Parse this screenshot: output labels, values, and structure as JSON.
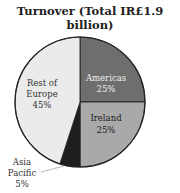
{
  "chart_data": {
    "type": "pie",
    "title": "Turnover (Total IR£1.9 billion)",
    "title_lines": [
      "Turnover (Total IR£1.9",
      "billion)"
    ],
    "categories": [
      "Americas",
      "Ireland",
      "Asia Pacific",
      "Rest of Europe"
    ],
    "values": [
      25,
      25,
      5,
      45
    ],
    "unit": "%",
    "slices": [
      {
        "label": "Americas",
        "value": 25,
        "display": "25%",
        "color": "#6e6e6e",
        "text_color": "#eeeeee"
      },
      {
        "label": "Ireland",
        "value": 25,
        "display": "25%",
        "color": "#a9a9a9",
        "text_color": "#222222"
      },
      {
        "label": "Asia Pacific",
        "label_lines": [
          "Asia",
          "Pacific"
        ],
        "value": 5,
        "display": "5%",
        "color": "#1e1e1e",
        "text_color": "#333333",
        "leader_line": true
      },
      {
        "label": "Rest of Europe",
        "label_lines": [
          "Rest of",
          "Europe"
        ],
        "value": 45,
        "display": "45%",
        "color": "#ebebeb",
        "text_color": "#333333"
      }
    ],
    "legend": "none"
  }
}
